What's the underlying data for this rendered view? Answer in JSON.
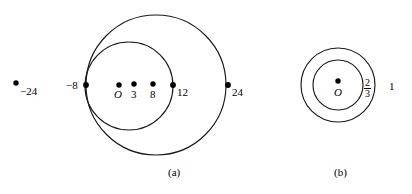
{
  "figure": {
    "background_color": "#ffffff",
    "stroke_color": "#1a1a1a",
    "dot_color": "#000000",
    "panels": [
      {
        "caption": "(a)",
        "caption_x": 168,
        "caption_y": 166,
        "circles": [
          {
            "name": "outer-circle",
            "cx": 156,
            "cy": 85,
            "r": 70
          },
          {
            "name": "inner-circle",
            "cx": 129,
            "cy": 86,
            "r": 44
          }
        ],
        "points": [
          {
            "name": "point-minus-24",
            "label": "−24",
            "x": 16,
            "y": 83,
            "label_x": 20,
            "label_y": 86,
            "label_align": "left"
          },
          {
            "name": "point-minus-8",
            "label": "−8",
            "x": 86,
            "y": 85,
            "label_x": 66,
            "label_y": 80,
            "label_align": "left"
          },
          {
            "name": "point-O",
            "label": "O",
            "x": 119,
            "y": 85,
            "label_x": 114,
            "label_y": 89,
            "label_align": "left",
            "italic": true
          },
          {
            "name": "point-3",
            "label": "3",
            "x": 134,
            "y": 84,
            "label_x": 131,
            "label_y": 89,
            "label_align": "left"
          },
          {
            "name": "point-8",
            "label": "8",
            "x": 153,
            "y": 84,
            "label_x": 150,
            "label_y": 89,
            "label_align": "left"
          },
          {
            "name": "point-12",
            "label": "12",
            "x": 173,
            "y": 85,
            "label_x": 177,
            "label_y": 87,
            "label_align": "left"
          },
          {
            "name": "point-24",
            "label": "24",
            "x": 228,
            "y": 85,
            "label_x": 232,
            "label_y": 87,
            "label_align": "left"
          }
        ]
      },
      {
        "caption": "(b)",
        "caption_x": 334,
        "caption_y": 166,
        "circles": [
          {
            "name": "outer-circle",
            "cx": 338,
            "cy": 85,
            "r": 37
          },
          {
            "name": "inner-circle",
            "cx": 338,
            "cy": 85,
            "r": 25
          }
        ],
        "points": [
          {
            "name": "point-O",
            "label": "O",
            "x": 338,
            "y": 81,
            "label_x": 334,
            "label_y": 87,
            "label_align": "left",
            "italic": true
          }
        ],
        "radius_labels": [
          {
            "name": "inner-radius-label",
            "numerator": "2",
            "denominator": "3",
            "x": 364,
            "y": 78
          },
          {
            "name": "outer-radius-label",
            "text": "1",
            "x": 389,
            "y": 81
          }
        ]
      }
    ]
  }
}
